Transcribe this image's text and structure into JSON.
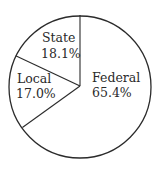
{
  "chart_data": {
    "type": "pie",
    "title": "",
    "categories": [
      "Federal",
      "State",
      "Local"
    ],
    "values": [
      65.4,
      18.1,
      17.0
    ],
    "unit": "%",
    "labels": [
      {
        "name": "Federal",
        "value_text": "65.4%"
      },
      {
        "name": "State",
        "value_text": "18.1%"
      },
      {
        "name": "Local",
        "value_text": "17.0%"
      }
    ],
    "start_angle_deg": 0,
    "direction": "counterclockwise-from-top for State, Local; Federal fills remainder clockwise",
    "legend": "none (inline slice labels)",
    "colors": {
      "fill": "#ffffff",
      "stroke": "#2b2b2b",
      "text": "#2a2a2a"
    }
  }
}
